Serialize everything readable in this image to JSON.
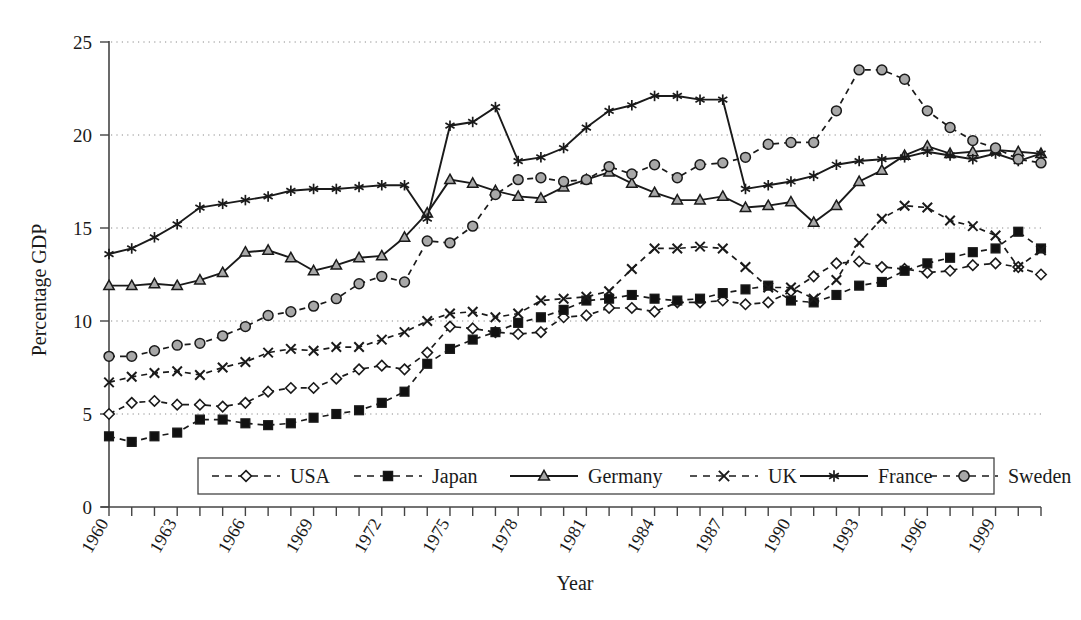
{
  "chart_data": {
    "type": "line",
    "title": "",
    "xlabel": "Year",
    "ylabel": "Percentage GDP",
    "xlim": [
      1960,
      2001
    ],
    "ylim": [
      0,
      25
    ],
    "yticks": [
      0,
      5,
      10,
      15,
      20,
      25
    ],
    "xticks": [
      1960,
      1961,
      1962,
      1963,
      1964,
      1965,
      1966,
      1967,
      1968,
      1969,
      1970,
      1971,
      1972,
      1973,
      1974,
      1975,
      1976,
      1977,
      1978,
      1979,
      1980,
      1981,
      1982,
      1983,
      1984,
      1985,
      1986,
      1987,
      1988,
      1989,
      1990,
      1991,
      1992,
      1993,
      1994,
      1995,
      1996,
      1997,
      1998,
      1999,
      2000,
      2001
    ],
    "xticklabels": [
      "1960",
      "",
      "",
      "1963",
      "",
      "",
      "1966",
      "",
      "",
      "1969",
      "",
      "",
      "1972",
      "",
      "",
      "1975",
      "",
      "",
      "1978",
      "",
      "",
      "1981",
      "",
      "",
      "1984",
      "",
      "",
      "1987",
      "",
      "",
      "1990",
      "",
      "",
      "1993",
      "",
      "",
      "1996",
      "",
      "",
      "1999",
      "",
      ""
    ],
    "grid": "horizontal-dotted",
    "legend_position": "inside-bottom-center",
    "x": [
      1960,
      1961,
      1962,
      1963,
      1964,
      1965,
      1966,
      1967,
      1968,
      1969,
      1970,
      1971,
      1972,
      1973,
      1974,
      1975,
      1976,
      1977,
      1978,
      1979,
      1980,
      1981,
      1982,
      1983,
      1984,
      1985,
      1986,
      1987,
      1988,
      1989,
      1990,
      1991,
      1992,
      1993,
      1994,
      1995,
      1996,
      1997,
      1998,
      1999,
      2000,
      2001
    ],
    "series": [
      {
        "name": "USA",
        "marker": "diamond-open",
        "linestyle": "dashed",
        "values": [
          5.0,
          5.6,
          5.7,
          5.5,
          5.5,
          5.4,
          5.6,
          6.2,
          6.4,
          6.4,
          6.9,
          7.4,
          7.6,
          7.4,
          8.3,
          9.7,
          9.6,
          9.4,
          9.3,
          9.4,
          10.2,
          10.3,
          10.7,
          10.7,
          10.5,
          11.0,
          11.0,
          11.1,
          10.9,
          11.0,
          11.6,
          12.4,
          13.1,
          13.2,
          12.9,
          12.8,
          12.6,
          12.7,
          13.0,
          13.1,
          12.9,
          12.5
        ]
      },
      {
        "name": "Japan",
        "marker": "square-filled",
        "linestyle": "dashed",
        "values": [
          3.8,
          3.5,
          3.8,
          4.0,
          4.7,
          4.7,
          4.5,
          4.4,
          4.5,
          4.8,
          5.0,
          5.2,
          5.6,
          6.2,
          7.7,
          8.5,
          9.0,
          9.4,
          9.9,
          10.2,
          10.6,
          11.1,
          11.2,
          11.4,
          11.2,
          11.1,
          11.2,
          11.5,
          11.7,
          11.9,
          11.1,
          11.0,
          11.4,
          11.9,
          12.1,
          12.7,
          13.1,
          13.4,
          13.7,
          13.9,
          14.8,
          13.9
        ]
      },
      {
        "name": "Germany",
        "marker": "triangle-filled",
        "linestyle": "solid",
        "values": [
          11.9,
          11.9,
          12.0,
          11.9,
          12.2,
          12.6,
          13.7,
          13.8,
          13.4,
          12.7,
          13.0,
          13.4,
          13.5,
          14.5,
          15.8,
          17.6,
          17.4,
          17.0,
          16.7,
          16.6,
          17.2,
          17.6,
          18.0,
          17.4,
          16.9,
          16.5,
          16.5,
          16.7,
          16.1,
          16.2,
          16.4,
          15.3,
          16.2,
          17.5,
          18.1,
          18.9,
          19.4,
          19.0,
          19.1,
          19.2,
          19.1,
          19.0
        ]
      },
      {
        "name": "UK",
        "marker": "x-cross",
        "linestyle": "dashed",
        "values": [
          6.7,
          7.0,
          7.2,
          7.3,
          7.1,
          7.5,
          7.8,
          8.3,
          8.5,
          8.4,
          8.6,
          8.6,
          9.0,
          9.4,
          10.0,
          10.4,
          10.5,
          10.2,
          10.4,
          11.1,
          11.2,
          11.3,
          11.6,
          12.8,
          13.9,
          13.9,
          14.0,
          13.9,
          12.9,
          11.8,
          11.8,
          11.2,
          12.2,
          14.2,
          15.5,
          16.2,
          16.1,
          15.4,
          15.1,
          14.6,
          12.9,
          13.8
        ]
      },
      {
        "name": "France",
        "marker": "asterisk",
        "linestyle": "solid",
        "values": [
          13.6,
          13.9,
          14.5,
          15.2,
          16.1,
          16.3,
          16.5,
          16.7,
          17.0,
          17.1,
          17.1,
          17.2,
          17.3,
          17.3,
          15.5,
          20.5,
          20.7,
          21.5,
          18.6,
          18.8,
          19.3,
          20.4,
          21.3,
          21.6,
          22.1,
          22.1,
          21.9,
          21.9,
          17.1,
          17.3,
          17.5,
          17.8,
          18.4,
          18.6,
          18.7,
          18.8,
          19.1,
          18.9,
          18.7,
          19.0,
          18.6,
          19.0
        ]
      },
      {
        "name": "Sweden",
        "marker": "circle-filled",
        "linestyle": "dashed",
        "values": [
          8.1,
          8.1,
          8.4,
          8.7,
          8.8,
          9.2,
          9.7,
          10.3,
          10.5,
          10.8,
          11.2,
          12.0,
          12.4,
          12.1,
          14.3,
          14.2,
          15.1,
          16.8,
          17.6,
          17.7,
          17.5,
          17.6,
          18.3,
          17.9,
          18.4,
          17.7,
          18.4,
          18.5,
          18.8,
          19.5,
          19.6,
          19.6,
          21.3,
          23.5,
          23.5,
          23.0,
          21.3,
          20.4,
          19.7,
          19.3,
          18.7,
          18.5
        ]
      }
    ]
  },
  "legend": {
    "items": [
      {
        "label": "USA",
        "marker": "diamond-open",
        "linestyle": "dashed"
      },
      {
        "label": "Japan",
        "marker": "square-filled",
        "linestyle": "dashed"
      },
      {
        "label": "Germany",
        "marker": "triangle-filled",
        "linestyle": "solid"
      },
      {
        "label": "UK",
        "marker": "x-cross",
        "linestyle": "dashed"
      },
      {
        "label": "France",
        "marker": "asterisk",
        "linestyle": "solid"
      },
      {
        "label": "Sweden",
        "marker": "circle-filled",
        "linestyle": "dashed"
      }
    ]
  },
  "colors": {
    "line": "#1a1a1a",
    "grid": "#8a8a8a",
    "axis": "#444444",
    "marker_fill_gray": "#a8a8a8",
    "marker_fill_white": "#ffffff",
    "marker_fill_black": "#111111",
    "background": "#ffffff"
  }
}
